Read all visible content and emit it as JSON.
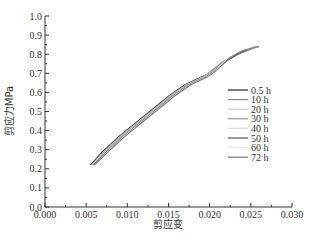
{
  "chart_data": {
    "type": "line",
    "title": "",
    "xlabel": "剪应变",
    "ylabel": "剪应力MPa",
    "xlim": [
      0.0,
      0.03
    ],
    "ylim": [
      0.0,
      1.0
    ],
    "xticks": [
      "0.000",
      "0.005",
      "0.010",
      "0.015",
      "0.020",
      "0.025",
      "0.030"
    ],
    "yticks": [
      "0.0",
      "0.1",
      "0.2",
      "0.3",
      "0.4",
      "0.5",
      "0.6",
      "0.7",
      "0.8",
      "0.9",
      "1.0"
    ],
    "grid": false,
    "legend_position": "right-center",
    "series": [
      {
        "name": "0.5 h",
        "color": "#222222",
        "x": [
          0.0055,
          0.007,
          0.009,
          0.011,
          0.013,
          0.015,
          0.017,
          0.019,
          0.02,
          0.0215,
          0.023,
          0.025
        ],
        "y": [
          0.22,
          0.29,
          0.37,
          0.44,
          0.51,
          0.58,
          0.64,
          0.68,
          0.7,
          0.75,
          0.79,
          0.83
        ]
      },
      {
        "name": "10 h",
        "color": "#888888",
        "x": [
          0.0056,
          0.0071,
          0.0091,
          0.0111,
          0.0131,
          0.0151,
          0.0171,
          0.0191,
          0.0201,
          0.0216,
          0.0232,
          0.0252
        ],
        "y": [
          0.22,
          0.29,
          0.37,
          0.44,
          0.51,
          0.58,
          0.64,
          0.68,
          0.71,
          0.76,
          0.8,
          0.83
        ]
      },
      {
        "name": "20 h",
        "color": "#cccccc",
        "x": [
          0.0057,
          0.0072,
          0.0092,
          0.0112,
          0.0132,
          0.0152,
          0.0172,
          0.0192,
          0.0202,
          0.0218,
          0.0234,
          0.0254
        ],
        "y": [
          0.22,
          0.29,
          0.37,
          0.44,
          0.51,
          0.58,
          0.64,
          0.68,
          0.71,
          0.76,
          0.8,
          0.84
        ]
      },
      {
        "name": "30 h",
        "color": "#999999",
        "x": [
          0.0058,
          0.0073,
          0.0093,
          0.0113,
          0.0133,
          0.0153,
          0.0173,
          0.0193,
          0.0203,
          0.022,
          0.0236,
          0.0256
        ],
        "y": [
          0.22,
          0.29,
          0.37,
          0.44,
          0.51,
          0.58,
          0.64,
          0.68,
          0.71,
          0.77,
          0.81,
          0.84
        ]
      },
      {
        "name": "40 h",
        "color": "#dddddd",
        "x": [
          0.0058,
          0.0074,
          0.0094,
          0.0114,
          0.0134,
          0.0154,
          0.0174,
          0.0194,
          0.0204,
          0.0221,
          0.0237,
          0.0257
        ],
        "y": [
          0.22,
          0.29,
          0.37,
          0.44,
          0.51,
          0.58,
          0.64,
          0.68,
          0.71,
          0.77,
          0.81,
          0.84
        ]
      },
      {
        "name": "50 h",
        "color": "#555555",
        "x": [
          0.0059,
          0.0075,
          0.0095,
          0.0115,
          0.0135,
          0.0155,
          0.0175,
          0.0195,
          0.0205,
          0.0222,
          0.0238,
          0.0258
        ],
        "y": [
          0.22,
          0.29,
          0.37,
          0.44,
          0.51,
          0.58,
          0.64,
          0.68,
          0.71,
          0.77,
          0.81,
          0.84
        ]
      },
      {
        "name": "60 h",
        "color": "#eeeeee",
        "x": [
          0.006,
          0.0076,
          0.0096,
          0.0116,
          0.0136,
          0.0156,
          0.0176,
          0.0196,
          0.0206,
          0.0223,
          0.0239,
          0.0259
        ],
        "y": [
          0.22,
          0.29,
          0.37,
          0.44,
          0.51,
          0.58,
          0.64,
          0.68,
          0.71,
          0.78,
          0.82,
          0.84
        ]
      },
      {
        "name": "72 h",
        "color": "#777777",
        "x": [
          0.006,
          0.0077,
          0.0097,
          0.0117,
          0.0137,
          0.0157,
          0.0177,
          0.0197,
          0.0207,
          0.0224,
          0.024,
          0.026
        ],
        "y": [
          0.22,
          0.29,
          0.37,
          0.44,
          0.51,
          0.58,
          0.64,
          0.68,
          0.71,
          0.78,
          0.82,
          0.84
        ]
      }
    ]
  }
}
